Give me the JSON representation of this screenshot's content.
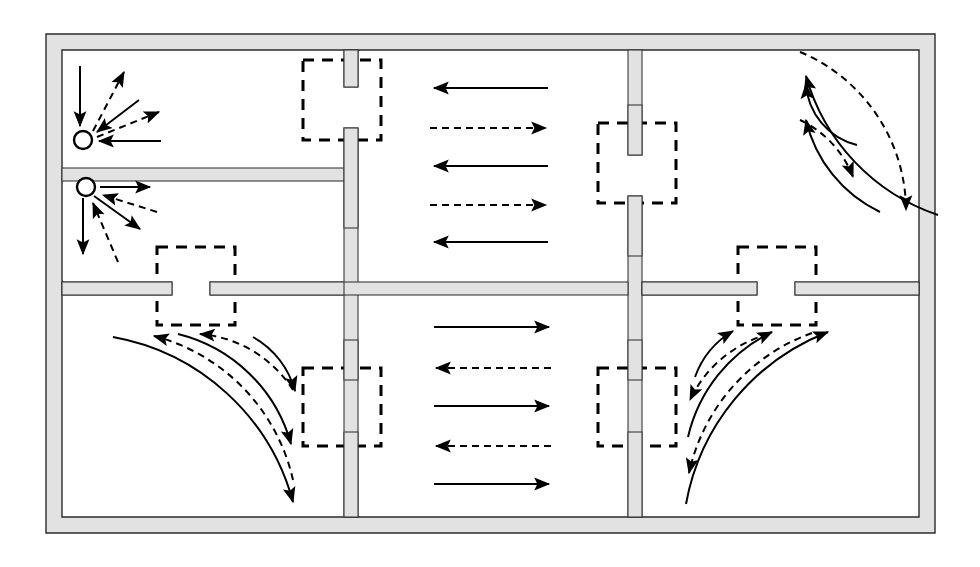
{
  "diagram": {
    "type": "floor-plan-flow-diagram",
    "canvas": {
      "width": 980,
      "height": 567
    },
    "colors": {
      "background": "#ffffff",
      "wall_fill": "#e2e2e2",
      "wall_stroke": "#3a3a3a",
      "flow_line": "#000000",
      "door_marker": "#000000"
    },
    "legend_semantics": {
      "solid_arrow": "solid flow path",
      "dashed_arrow": "dashed flow path",
      "dashed_square": "door opening marker",
      "open_circle": "point node / source"
    }
  },
  "structure": {
    "outer_wall": {
      "label": "outer-wall",
      "x": 46,
      "y": 34,
      "width": 889,
      "height": 499,
      "thickness": 16
    },
    "vertical_walls": [
      {
        "label": "vertical-wall-left",
        "x": 344,
        "y": 50,
        "width": 14,
        "height": 467,
        "door_gap": {
          "y": 87,
          "height": 41
        }
      },
      {
        "label": "vertical-wall-right",
        "x": 628,
        "y": 50,
        "width": 14,
        "height": 467,
        "door_gap": {
          "y": 155,
          "height": 41
        }
      }
    ],
    "horizontal_walls": [
      {
        "label": "horizontal-wall-upper-left",
        "x": 62,
        "y": 168,
        "width": 282,
        "height": 13,
        "door_gap": null
      },
      {
        "label": "horizontal-wall-mid",
        "x": 62,
        "y": 282,
        "width": 873,
        "height": 13,
        "door_gaps": [
          {
            "x": 172,
            "width": 38
          },
          {
            "x": 757,
            "width": 38
          }
        ]
      }
    ],
    "door_markers": [
      {
        "label": "door-marker-top-left-middle",
        "x": 303,
        "y": 60,
        "width": 78,
        "height": 80
      },
      {
        "label": "door-marker-top-middle-right",
        "x": 598,
        "y": 123,
        "width": 78,
        "height": 80
      },
      {
        "label": "door-marker-left-vertical-mid",
        "x": 157,
        "y": 247,
        "width": 78,
        "height": 78
      },
      {
        "label": "door-marker-right-vertical-mid",
        "x": 738,
        "y": 247,
        "width": 78,
        "height": 78
      },
      {
        "label": "door-marker-bottom-left-middle",
        "x": 303,
        "y": 368,
        "width": 78,
        "height": 78
      },
      {
        "label": "door-marker-bottom-middle-right",
        "x": 598,
        "y": 368,
        "width": 78,
        "height": 78
      }
    ]
  },
  "rooms": [
    {
      "id": "room-top-left-upper",
      "label": "top-left-upper-room",
      "flow": "radial-node"
    },
    {
      "id": "room-top-left-lower",
      "label": "top-left-lower-room",
      "flow": "radial-node"
    },
    {
      "id": "room-top-middle",
      "label": "top-middle-room",
      "flow": "horizontal-bidirectional"
    },
    {
      "id": "room-top-right",
      "label": "top-right-room",
      "flow": "arc-nested"
    },
    {
      "id": "room-bottom-left",
      "label": "bottom-left-room",
      "flow": "arc-nested"
    },
    {
      "id": "room-bottom-middle",
      "label": "bottom-middle-room",
      "flow": "horizontal-bidirectional"
    },
    {
      "id": "room-bottom-right",
      "label": "bottom-right-room",
      "flow": "arc-nested"
    }
  ],
  "nodes": [
    {
      "label": "node-circle-upper",
      "cx": 83,
      "cy": 140,
      "r": 9
    },
    {
      "label": "node-circle-lower",
      "cx": 86,
      "cy": 187,
      "r": 9
    }
  ],
  "flows": {
    "node_upper_rays": [
      {
        "style": "solid",
        "direction": "inbound",
        "from": [
          80,
          66
        ],
        "to": [
          80,
          128
        ]
      },
      {
        "style": "dashed",
        "direction": "outbound",
        "from": [
          92,
          130
        ],
        "to": [
          123,
          70
        ]
      },
      {
        "style": "solid",
        "direction": "inbound",
        "from": [
          137,
          101
        ],
        "to": [
          95,
          133
        ]
      },
      {
        "style": "dashed",
        "direction": "outbound",
        "from": [
          96,
          136
        ],
        "to": [
          160,
          111
        ]
      },
      {
        "style": "solid",
        "direction": "inbound",
        "from": [
          160,
          141
        ],
        "to": [
          97,
          141
        ]
      }
    ],
    "node_lower_rays": [
      {
        "style": "solid",
        "direction": "outbound",
        "from": [
          99,
          187
        ],
        "to": [
          150,
          187
        ]
      },
      {
        "style": "dashed",
        "direction": "inbound",
        "from": [
          156,
          211
        ],
        "to": [
          101,
          193
        ]
      },
      {
        "style": "solid",
        "direction": "outbound",
        "from": [
          94,
          195
        ],
        "to": [
          139,
          228
        ]
      },
      {
        "style": "dashed",
        "direction": "inbound",
        "from": [
          117,
          260
        ],
        "to": [
          92,
          202
        ]
      },
      {
        "style": "solid",
        "direction": "outbound",
        "from": [
          83,
          197
        ],
        "to": [
          83,
          253
        ]
      }
    ],
    "top_middle_arrows": [
      {
        "style": "solid",
        "direction": "left",
        "y": 88,
        "x1": 432,
        "x2": 548
      },
      {
        "style": "dashed",
        "direction": "right",
        "y": 128,
        "x1": 430,
        "x2": 548
      },
      {
        "style": "solid",
        "direction": "left",
        "y": 166,
        "x1": 432,
        "x2": 548
      },
      {
        "style": "dashed",
        "direction": "right",
        "y": 205,
        "x1": 430,
        "x2": 548
      },
      {
        "style": "solid",
        "direction": "left",
        "y": 242,
        "x1": 432,
        "x2": 548
      }
    ],
    "bottom_middle_arrows": [
      {
        "style": "solid",
        "direction": "right",
        "y": 327,
        "x1": 434,
        "x2": 551
      },
      {
        "style": "dashed",
        "direction": "left",
        "y": 368,
        "x1": 434,
        "x2": 551
      },
      {
        "style": "solid",
        "direction": "right",
        "y": 406,
        "x1": 434,
        "x2": 551
      },
      {
        "style": "dashed",
        "direction": "left",
        "y": 446,
        "x1": 434,
        "x2": 551
      },
      {
        "style": "solid",
        "direction": "right",
        "y": 484,
        "x1": 434,
        "x2": 551
      }
    ],
    "top_right_arcs": {
      "center": [
        870,
        78
      ],
      "description": "nested quarter arcs, arrow at left end and bottom end",
      "arcs": [
        {
          "style": "solid",
          "radius": 52,
          "arrow_left": true,
          "arrow_bottom": false
        },
        {
          "style": "dashed",
          "radius": 88,
          "arrow_left": false,
          "arrow_bottom": true
        },
        {
          "style": "solid",
          "radius": 122,
          "arrow_left": true,
          "arrow_bottom": false
        },
        {
          "style": "dashed",
          "radius": 158,
          "arrow_left": false,
          "arrow_bottom": true
        },
        {
          "style": "solid",
          "radius": 192,
          "arrow_left": true,
          "arrow_bottom": true
        }
      ]
    },
    "bottom_left_arcs": {
      "center": [
        94,
        486
      ],
      "description": "nested quarter arcs, arrow at top end and right end",
      "arcs": [
        {
          "style": "solid",
          "radius": 55,
          "arrow_top": false,
          "arrow_right": true
        },
        {
          "style": "dashed",
          "radius": 92,
          "arrow_top": true,
          "arrow_right": false
        },
        {
          "style": "solid",
          "radius": 128,
          "arrow_top": false,
          "arrow_right": true
        },
        {
          "style": "dashed",
          "radius": 164,
          "arrow_top": true,
          "arrow_right": false
        },
        {
          "style": "solid",
          "radius": 198,
          "arrow_top": false,
          "arrow_right": true
        }
      ]
    },
    "bottom_right_arcs": {
      "center": [
        888,
        490
      ],
      "description": "nested quarter arcs, arrow at top end and left end",
      "arcs": [
        {
          "style": "solid",
          "radius": 58,
          "arrow_top": true,
          "arrow_left": false
        },
        {
          "style": "dashed",
          "radius": 94,
          "arrow_top": false,
          "arrow_left": true
        },
        {
          "style": "solid",
          "radius": 130,
          "arrow_top": true,
          "arrow_left": false
        },
        {
          "style": "dashed",
          "radius": 166,
          "arrow_top": false,
          "arrow_left": true
        },
        {
          "style": "solid",
          "radius": 200,
          "arrow_top": true,
          "arrow_left": false
        }
      ]
    }
  }
}
